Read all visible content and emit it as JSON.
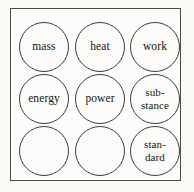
{
  "figure": {
    "kind": "circle-grid-diagram",
    "rows": 3,
    "columns": 3,
    "border_color": "#4a4a48",
    "circle_color": "#3c3c3a",
    "text_color": "#15140f",
    "background_color": "#fbfaf7"
  },
  "cells": [
    {
      "row": 0,
      "col": 0,
      "label": "mass",
      "empty": false,
      "lines": 1
    },
    {
      "row": 0,
      "col": 1,
      "label": "heat",
      "empty": false,
      "lines": 1
    },
    {
      "row": 0,
      "col": 2,
      "label": "work",
      "empty": false,
      "lines": 1
    },
    {
      "row": 1,
      "col": 0,
      "label": "energy",
      "empty": false,
      "lines": 1
    },
    {
      "row": 1,
      "col": 1,
      "label": "power",
      "empty": false,
      "lines": 1
    },
    {
      "row": 1,
      "col": 2,
      "label": "sub-\nstance",
      "empty": false,
      "lines": 2
    },
    {
      "row": 2,
      "col": 0,
      "label": "",
      "empty": true,
      "lines": 0
    },
    {
      "row": 2,
      "col": 1,
      "label": "",
      "empty": true,
      "lines": 0
    },
    {
      "row": 2,
      "col": 2,
      "label": "stan-\ndard",
      "empty": false,
      "lines": 2
    }
  ]
}
